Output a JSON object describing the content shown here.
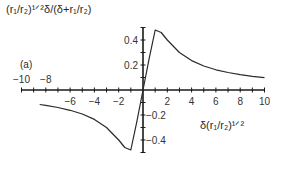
{
  "chart_data": {
    "type": "line",
    "title": "",
    "panel_label": "(a)",
    "xlabel": "δ(r₁/r₂)^1/2",
    "ylabel": "(r₁/r₂)^1/2 δ/(δ+r₁/r₂)",
    "xlim": [
      -10,
      10
    ],
    "ylim": [
      -0.5,
      0.5
    ],
    "grid": false,
    "legend": null,
    "x_ticks": [
      -10,
      -8,
      -6,
      -4,
      -2,
      2,
      4,
      6,
      8,
      10
    ],
    "x_tick_labels": [
      "−10",
      "−8",
      "−6",
      "−4",
      "−2",
      "2",
      "4",
      "6",
      "8",
      "10"
    ],
    "y_ticks": [
      0.4,
      0.2,
      -0.2,
      -0.4
    ],
    "y_tick_labels": [
      "0.4",
      "0.2",
      "−0.2",
      "−0.4"
    ],
    "series": [
      {
        "name": "curve",
        "x": [
          -8.5,
          -8,
          -7,
          -6,
          -5,
          -4,
          -3,
          -2,
          -1.5,
          -1,
          -0.5,
          0,
          0.5,
          1,
          1.5,
          2,
          3,
          4,
          5,
          6,
          7,
          8,
          9,
          10
        ],
        "y": [
          -0.116,
          -0.123,
          -0.14,
          -0.162,
          -0.192,
          -0.235,
          -0.3,
          -0.4,
          -0.46,
          -0.48,
          -0.25,
          0,
          0.25,
          0.48,
          0.46,
          0.4,
          0.3,
          0.235,
          0.192,
          0.162,
          0.14,
          0.123,
          0.11,
          0.099
        ]
      }
    ],
    "annotations": [
      "peak ≈ 0.48 near x ≈ 1",
      "minimum ≈ −0.48 near x ≈ −1"
    ]
  },
  "labels": {
    "ylabel": "(r₁/r₂)¹ᐟ²δ/(δ+r₁/r₂)",
    "xlabel": "δ(r₁/r₂)¹ᐟ²",
    "panel": "(a)"
  }
}
